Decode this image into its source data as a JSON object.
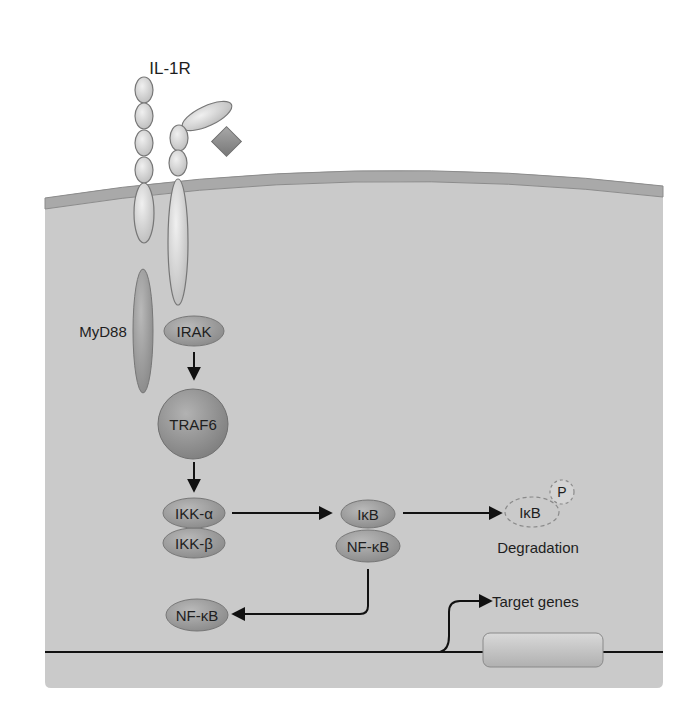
{
  "labels": {
    "receptor": "IL-1R",
    "myd88": "MyD88",
    "irak": "IRAK",
    "traf6": "TRAF6",
    "ikk_alpha": "IKK-α",
    "ikk_beta": "IKK-β",
    "ikb": "IκB",
    "nfkb_complex": "NF-κB",
    "ikb_degraded": "IκB",
    "phospho": "P",
    "degradation": "Degradation",
    "nfkb_free": "NF-κB",
    "target_genes": "Target genes"
  },
  "colors": {
    "cytoplasm": "#c9c9c9",
    "membrane": "#a8a8a8",
    "protein_dark": "#9a9a9a",
    "protein_light": "#d8d8d8",
    "ligand": "#8f8f8f",
    "arrow": "#111111"
  },
  "flow": [
    {
      "from": "IRAK",
      "to": "TRAF6"
    },
    {
      "from": "TRAF6",
      "to": "IKK-α/IKK-β"
    },
    {
      "from": "IKK-α/IKK-β",
      "to": "IκB/NF-κB"
    },
    {
      "from": "IκB/NF-κB",
      "to": "IκB-P (Degradation)"
    },
    {
      "from": "IκB/NF-κB",
      "to": "NF-κB"
    },
    {
      "from": "Promoter",
      "to": "Target genes"
    }
  ]
}
